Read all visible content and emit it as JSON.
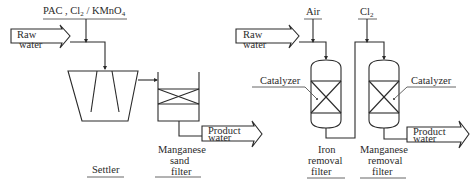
{
  "diagram": {
    "left_process": {
      "chemicals_label": "PAC , Cl",
      "chemicals_sub": "2",
      "chemicals_rest": " / KMnO",
      "chemicals_sub2": "4",
      "inlet_line1": "Raw",
      "inlet_line2": "water",
      "settler_label": "Settler",
      "filter_label_line1": "Manganese",
      "filter_label_line2": "sand",
      "filter_label_line3": "filter",
      "outlet_line1": "Product",
      "outlet_line2": "water"
    },
    "right_process": {
      "air_label": "Air",
      "cl2_label": "Cl",
      "cl2_sub": "2",
      "inlet_line1": "Raw",
      "inlet_line2": "water",
      "catalyzer_left": "Catalyzer",
      "catalyzer_right": "Catalyzer",
      "iron_filter_line1": "Iron",
      "iron_filter_line2": "removal",
      "iron_filter_line3": "filter",
      "mn_filter_line1": "Manganese",
      "mn_filter_line2": "removal",
      "mn_filter_line3": "filter",
      "outlet_line1": "Product",
      "outlet_line2": "water"
    }
  }
}
